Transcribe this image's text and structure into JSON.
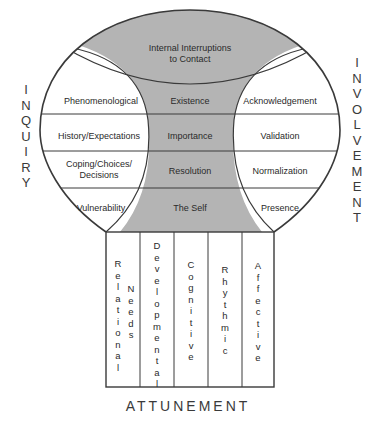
{
  "diagram": {
    "top_region": {
      "line1": "Internal Interruptions",
      "line2": "to Contact"
    },
    "rows": [
      {
        "left": "Phenomenological",
        "center": "Existence",
        "right": "Acknowledgement"
      },
      {
        "left": "History/Expectations",
        "center": "Importance",
        "right": "Validation"
      },
      {
        "left_line1": "Coping/Choices/",
        "left_line2": "Decisions",
        "center": "Resolution",
        "right": "Normalization"
      },
      {
        "left": "Vulnerability",
        "center": "The Self",
        "right": "Presence"
      }
    ],
    "columns": [
      {
        "line1": "Relational",
        "line2": "Needs"
      },
      {
        "line1": "Developmental"
      },
      {
        "line1": "Cognitive"
      },
      {
        "line1": "Rhythmic"
      },
      {
        "line1": "Affective"
      }
    ],
    "left_axis_label": "INQUIRY",
    "right_axis_label": "INVOLVEMENT",
    "bottom_axis_label": "ATTUNEMENT",
    "colors": {
      "shade": "#b4b4b4",
      "line": "#3a3a3a",
      "background": "#ffffff"
    }
  }
}
